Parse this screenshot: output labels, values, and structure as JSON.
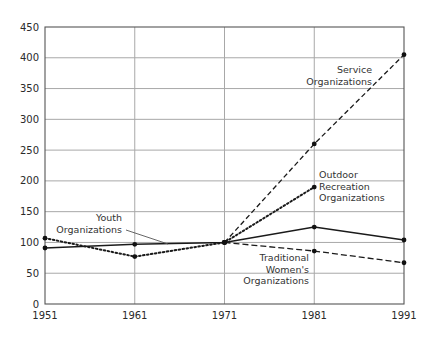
{
  "chart_data": {
    "type": "line",
    "title": "",
    "xlabel": "",
    "ylabel": "",
    "x": [
      1951,
      1961,
      1971,
      1981,
      1991
    ],
    "xticks": [
      "1951",
      "1961",
      "1971",
      "1981",
      "1991"
    ],
    "yticks": [
      "0",
      "50",
      "100",
      "150",
      "200",
      "250",
      "300",
      "350",
      "400",
      "450"
    ],
    "ylim": [
      0,
      450
    ],
    "grid": true,
    "legend": "inline labels",
    "series": [
      {
        "name": "Service Organizations",
        "label_lines": [
          "Service",
          "Organizations"
        ],
        "style": "dashed",
        "values": [
          null,
          null,
          100,
          260,
          405
        ]
      },
      {
        "name": "Outdoor Recreation Organizations",
        "label_lines": [
          "Outdoor",
          "Recreation",
          "Organizations"
        ],
        "style": "dotted",
        "values": [
          107,
          77,
          100,
          190,
          null
        ]
      },
      {
        "name": "Youth Organizations",
        "label_lines": [
          "Youth",
          "Organizations"
        ],
        "style": "solid",
        "values": [
          91,
          97,
          100,
          125,
          104
        ]
      },
      {
        "name": "Traditional Women's Organizations",
        "label_lines": [
          "Traditional",
          "Women's",
          "Organizations"
        ],
        "style": "dash",
        "values": [
          null,
          null,
          100,
          86,
          67
        ]
      }
    ]
  }
}
